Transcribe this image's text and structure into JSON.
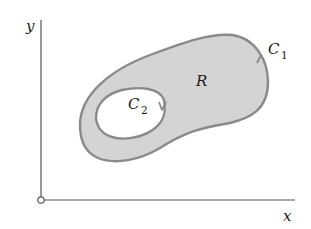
{
  "diagram": {
    "axes": {
      "x_label": "x",
      "y_label": "y",
      "axis_color": "#555555"
    },
    "region": {
      "label": "R",
      "fill_color": "#d4d4d4",
      "boundary_color": "#8a8a8a"
    },
    "outer_curve": {
      "label_main": "C",
      "label_sub": "1",
      "orientation": "counterclockwise"
    },
    "inner_curve": {
      "label_main": "C",
      "label_sub": "2",
      "orientation": "clockwise"
    }
  }
}
